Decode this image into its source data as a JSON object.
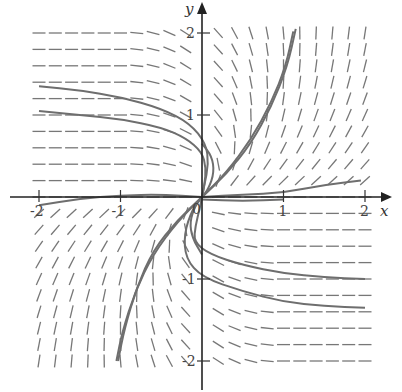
{
  "chart_data": {
    "type": "direction-field",
    "title": "",
    "xlabel": "x",
    "ylabel": "y",
    "xlim": [
      -2,
      2
    ],
    "ylim": [
      -2,
      2
    ],
    "x_ticks": [
      -2,
      -1,
      0,
      1,
      2
    ],
    "y_ticks": [
      -2,
      -1,
      1,
      2
    ],
    "x_tick_labels": [
      "-2",
      "-1",
      "0",
      "1",
      "2"
    ],
    "y_tick_labels": [
      "-2",
      "-1",
      "1",
      "2"
    ],
    "grid": false,
    "field_grid_step": 0.2,
    "colors": {
      "axis": "#222222",
      "field": "#777777",
      "curve": "#6e6e6e"
    },
    "solution_curves": [
      {
        "name": "upper-left-1",
        "points": [
          [
            -2,
            1.35
          ],
          [
            -1.5,
            1.3
          ],
          [
            -1,
            1.22
          ],
          [
            -0.5,
            1.08
          ],
          [
            -0.15,
            0.9
          ],
          [
            0.05,
            0.65
          ],
          [
            0.08,
            0.4
          ],
          [
            0.03,
            0.15
          ],
          [
            0,
            0
          ]
        ]
      },
      {
        "name": "upper-left-2",
        "points": [
          [
            -2,
            1.05
          ],
          [
            -1.5,
            1.0
          ],
          [
            -1,
            0.95
          ],
          [
            -0.5,
            0.85
          ],
          [
            -0.2,
            0.72
          ],
          [
            0,
            0.55
          ],
          [
            0.05,
            0.35
          ],
          [
            0.03,
            0.15
          ],
          [
            0,
            0
          ]
        ]
      },
      {
        "name": "upper-loop",
        "points": [
          [
            0,
            0.65
          ],
          [
            0.12,
            0.5
          ],
          [
            0.15,
            0.3
          ],
          [
            0.08,
            0.1
          ],
          [
            0,
            0
          ]
        ]
      },
      {
        "name": "upper-right-1",
        "points": [
          [
            0,
            0
          ],
          [
            0.3,
            0.28
          ],
          [
            0.6,
            0.65
          ],
          [
            0.85,
            1.1
          ],
          [
            1.05,
            1.6
          ],
          [
            1.15,
            2.05
          ]
        ]
      },
      {
        "name": "upper-right-2",
        "points": [
          [
            0,
            0
          ],
          [
            0.3,
            0.3
          ],
          [
            0.6,
            0.7
          ],
          [
            0.85,
            1.15
          ],
          [
            1.03,
            1.6
          ],
          [
            1.12,
            2.02
          ]
        ]
      },
      {
        "name": "x-axis-left",
        "points": [
          [
            -2,
            -0.1
          ],
          [
            -1.5,
            -0.02
          ],
          [
            -1,
            0.02
          ],
          [
            -0.5,
            0.03
          ],
          [
            0,
            0
          ]
        ]
      },
      {
        "name": "x-axis-right",
        "points": [
          [
            0,
            0
          ],
          [
            0.5,
            0.03
          ],
          [
            1,
            0.05
          ],
          [
            1.5,
            0.15
          ],
          [
            1.95,
            0.2
          ]
        ]
      },
      {
        "name": "x-axis-right-low",
        "points": [
          [
            0,
            -0.03
          ],
          [
            0.5,
            -0.05
          ],
          [
            1,
            -0.03
          ]
        ]
      },
      {
        "name": "lower-right-1",
        "points": [
          [
            2,
            -1.0
          ],
          [
            1.5,
            -0.98
          ],
          [
            1,
            -0.93
          ],
          [
            0.5,
            -0.83
          ],
          [
            0.1,
            -0.7
          ],
          [
            -0.1,
            -0.55
          ],
          [
            -0.08,
            -0.35
          ],
          [
            -0.03,
            -0.15
          ],
          [
            0,
            0
          ]
        ]
      },
      {
        "name": "lower-right-2",
        "points": [
          [
            2,
            -1.35
          ],
          [
            1.5,
            -1.33
          ],
          [
            1,
            -1.28
          ],
          [
            0.5,
            -1.15
          ],
          [
            0,
            -0.98
          ],
          [
            -0.2,
            -0.75
          ],
          [
            -0.22,
            -0.45
          ],
          [
            -0.12,
            -0.15
          ],
          [
            0,
            0
          ]
        ]
      },
      {
        "name": "lower-loop",
        "points": [
          [
            0,
            -0.7
          ],
          [
            -0.12,
            -0.5
          ],
          [
            -0.15,
            -0.3
          ],
          [
            -0.08,
            -0.1
          ],
          [
            0,
            0
          ]
        ]
      },
      {
        "name": "lower-left-1",
        "points": [
          [
            0,
            0
          ],
          [
            -0.3,
            -0.28
          ],
          [
            -0.6,
            -0.65
          ],
          [
            -0.8,
            -1.1
          ],
          [
            -0.95,
            -1.6
          ],
          [
            -1.03,
            -2.0
          ]
        ]
      },
      {
        "name": "lower-left-2",
        "points": [
          [
            0,
            0
          ],
          [
            -0.3,
            -0.3
          ],
          [
            -0.6,
            -0.7
          ],
          [
            -0.82,
            -1.15
          ],
          [
            -0.98,
            -1.65
          ],
          [
            -1.05,
            -2.0
          ]
        ]
      }
    ]
  }
}
